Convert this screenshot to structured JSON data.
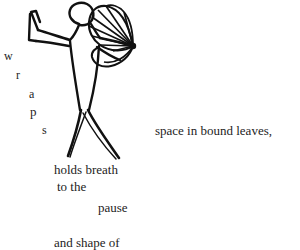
{
  "canvas": {
    "width": 300,
    "height": 250,
    "background_color": "#ffffff",
    "ink_color": "#111111",
    "text_color": "#1d1d1d"
  },
  "artwork": {
    "name": "dancer-with-fan",
    "description": "black ink line drawing of a dancing figure with one arm raised and a folding fan held in the other hand",
    "style": "line-drawing"
  },
  "poem": {
    "vertical_word": {
      "word": "wraps",
      "letters": [
        {
          "char": "w"
        },
        {
          "char": "r"
        },
        {
          "char": "a"
        },
        {
          "char": "p"
        },
        {
          "char": "s"
        }
      ]
    },
    "lines": [
      {
        "id": "space",
        "text": "space in bound leaves,"
      },
      {
        "id": "holds",
        "text": "holds breath"
      },
      {
        "id": "tothe",
        "text": "to the"
      },
      {
        "id": "pause",
        "text": "pause"
      },
      {
        "id": "andshape",
        "text": "and shape of"
      }
    ]
  }
}
